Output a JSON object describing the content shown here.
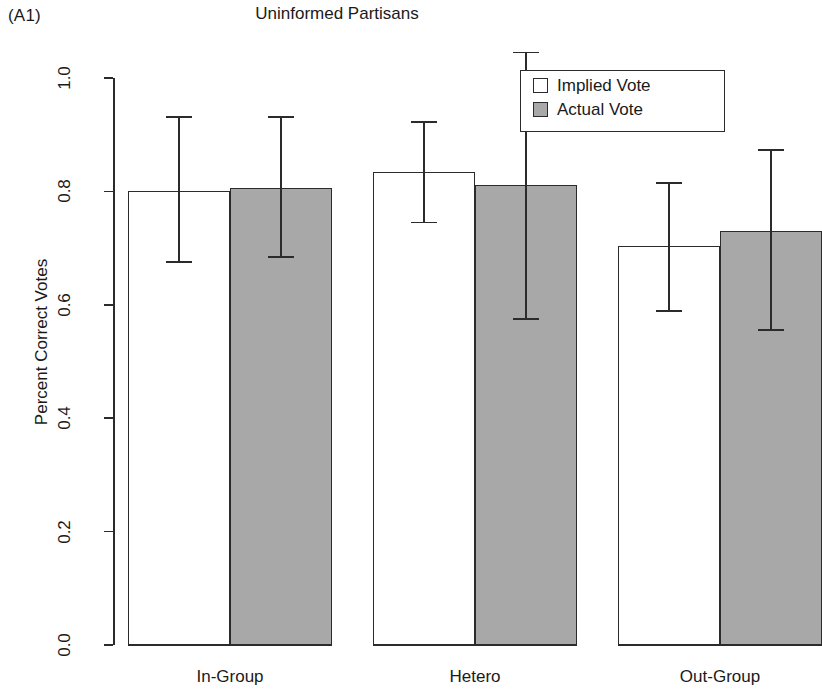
{
  "panel_tag": "(A1)",
  "chart_data": {
    "type": "bar",
    "title": "Uninformed Partisans",
    "xlabel": "",
    "ylabel": "Percent Correct Votes",
    "ylim": [
      0.0,
      1.0
    ],
    "ytick_labels": [
      "0.0",
      "0.2",
      "0.4",
      "0.6",
      "0.8",
      "1.0"
    ],
    "ytick_values": [
      0.0,
      0.2,
      0.4,
      0.6,
      0.8,
      1.0
    ],
    "grid": false,
    "legend_position": "top-right",
    "categories": [
      "In-Group",
      "Hetero",
      "Out-Group"
    ],
    "series": [
      {
        "name": "Implied Vote",
        "color": "#ffffff",
        "values": [
          0.801,
          0.834,
          0.704
        ],
        "error_low": [
          0.676,
          0.745,
          0.589
        ],
        "error_high": [
          0.931,
          0.922,
          0.815
        ]
      },
      {
        "name": "Actual Vote",
        "color": "#a8a8a8",
        "values": [
          0.806,
          0.811,
          0.73
        ],
        "error_low": [
          0.685,
          0.575,
          0.555
        ],
        "error_high": [
          0.931,
          1.045,
          0.873
        ]
      }
    ]
  }
}
